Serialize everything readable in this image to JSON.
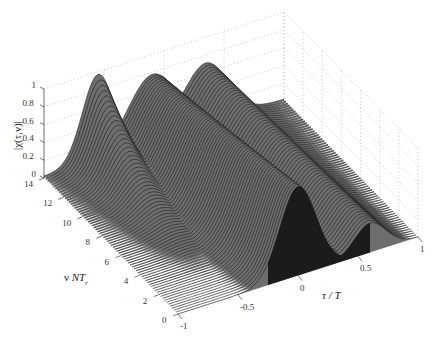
{
  "chart_data": {
    "type": "surface3d",
    "title": "",
    "zlabel": "|χ(τ,ν)|",
    "xlabel": "τ / T",
    "ylabel_prefix": "ν ",
    "ylabel_main": "NT",
    "ylabel_sub": "r",
    "x_ticks": [
      "-1",
      "-0.5",
      "0",
      "0.5",
      "1"
    ],
    "x_tick_values": [
      -1,
      -0.5,
      0,
      0.5,
      1
    ],
    "y_ticks": [
      "0",
      "2",
      "4",
      "6",
      "8",
      "10",
      "12",
      "14"
    ],
    "y_tick_values": [
      0,
      2,
      4,
      6,
      8,
      10,
      12,
      14
    ],
    "z_ticks": [
      "0",
      "0.2",
      "0.4",
      "0.6",
      "0.8",
      "1"
    ],
    "z_tick_values": [
      0,
      0.2,
      0.4,
      0.6,
      0.8,
      1
    ],
    "xlim": [
      -1,
      1
    ],
    "ylim": [
      0,
      14
    ],
    "zlim": [
      0,
      1
    ],
    "grid": true,
    "colormap": "gray mesh",
    "peaks": [
      {
        "tau": 0,
        "nu": 0,
        "z": 1.0
      },
      {
        "tau": 0.67,
        "nu": 0,
        "z": 0.33
      },
      {
        "tau": -0.5,
        "nu": 13,
        "z": 0.95
      },
      {
        "tau": 0,
        "nu": 13,
        "z": 0.65
      },
      {
        "tau": 0.3,
        "nu": 13,
        "z": 0.75
      }
    ]
  },
  "colors": {
    "background": "#ffffff",
    "mesh_line": "#1a1a1a",
    "surface_fill": "#6e6e6e",
    "grid": "#b0b0b0",
    "axis": "#555555"
  }
}
